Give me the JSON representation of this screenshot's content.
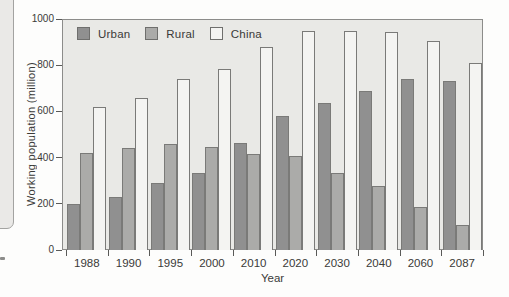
{
  "chart_data": {
    "type": "bar",
    "title": "",
    "categories": [
      "1988",
      "1990",
      "1995",
      "2000",
      "2010",
      "2020",
      "2030",
      "2040",
      "2060",
      "2087"
    ],
    "series": [
      {
        "name": "Urban",
        "color": "#909090",
        "values": [
          200,
          230,
          290,
          335,
          465,
          580,
          635,
          690,
          740,
          730
        ]
      },
      {
        "name": "Rural",
        "color": "#ababa9",
        "values": [
          420,
          440,
          460,
          445,
          415,
          405,
          335,
          275,
          185,
          110
        ]
      },
      {
        "name": "China",
        "color": "#f4f4f2",
        "values": [
          620,
          660,
          740,
          785,
          880,
          950,
          950,
          945,
          905,
          810
        ]
      }
    ],
    "xlabel": "Year",
    "ylabel": "Working population (million)",
    "ylim": [
      0,
      1000
    ],
    "yticks": [
      0,
      200,
      400,
      600,
      800,
      1000
    ],
    "legend_position": "top-left-inside",
    "grid": false
  },
  "colors": {
    "page_bg": "#fdfdfc",
    "plot_bg": "#e9e9e6",
    "plot_border": "#8c8c8a",
    "bar_outline": "#7a7a78",
    "text": "#3a3a38",
    "fragment_bg": "#eae9e7",
    "fragment_border": "#a3a3a1"
  }
}
